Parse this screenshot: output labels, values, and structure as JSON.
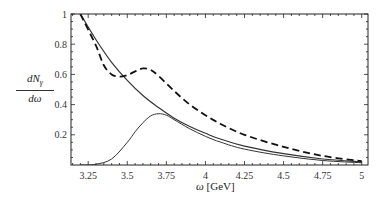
{
  "chart_data": {
    "type": "line",
    "title": "",
    "xlabel": "ω [GeV]",
    "ylabel": "dN_γ / dω",
    "ylabel_num": "dN",
    "ylabel_sub": "γ",
    "ylabel_den": "dω",
    "xlabel_sym": "ω",
    "xlabel_unit": "[GeV]",
    "xlim": [
      3.14,
      5.04
    ],
    "ylim": [
      0,
      1.0
    ],
    "grid": false,
    "legend": null,
    "x_ticks": [
      3.25,
      3.5,
      3.75,
      4,
      4.25,
      4.5,
      4.75,
      5
    ],
    "x_tick_labels": [
      "3.25",
      "3.5",
      "3.75",
      "4",
      "4.25",
      "4.5",
      "4.75",
      "5"
    ],
    "y_ticks": [
      0.2,
      0.4,
      0.6,
      0.8,
      1.0
    ],
    "y_tick_labels": [
      "0.2",
      "0.4",
      "0.6",
      "0.8",
      "1"
    ],
    "series": [
      {
        "name": "exponential background (solid)",
        "style": "solid",
        "x": [
          3.2,
          3.3,
          3.4,
          3.5,
          3.6,
          3.7,
          3.8,
          3.9,
          4.0,
          4.1,
          4.25,
          4.5,
          4.75,
          5.0
        ],
        "y": [
          1.0,
          0.83,
          0.68,
          0.56,
          0.46,
          0.38,
          0.31,
          0.255,
          0.21,
          0.17,
          0.125,
          0.075,
          0.04,
          0.02
        ]
      },
      {
        "name": "peak (solid)",
        "style": "solid",
        "x": [
          3.2,
          3.3,
          3.4,
          3.5,
          3.55,
          3.6,
          3.65,
          3.7,
          3.75,
          3.8,
          3.9,
          4.0,
          4.1,
          4.25,
          4.5,
          4.75,
          5.0
        ],
        "y": [
          0.0,
          0.005,
          0.04,
          0.15,
          0.22,
          0.28,
          0.325,
          0.34,
          0.33,
          0.3,
          0.24,
          0.19,
          0.15,
          0.105,
          0.06,
          0.03,
          0.015
        ]
      },
      {
        "name": "total (dashed)",
        "style": "dashed",
        "x": [
          3.2,
          3.3,
          3.35,
          3.4,
          3.45,
          3.5,
          3.55,
          3.6,
          3.65,
          3.7,
          3.8,
          3.9,
          4.0,
          4.1,
          4.25,
          4.5,
          4.75,
          5.0
        ],
        "y": [
          1.0,
          0.79,
          0.66,
          0.6,
          0.585,
          0.595,
          0.62,
          0.64,
          0.63,
          0.59,
          0.49,
          0.4,
          0.33,
          0.27,
          0.2,
          0.12,
          0.06,
          0.025
        ]
      }
    ]
  }
}
